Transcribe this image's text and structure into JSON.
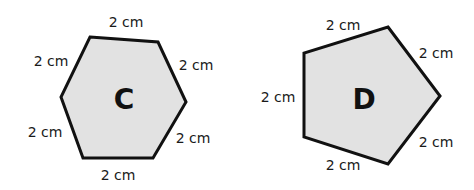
{
  "colors": {
    "fill": "#e2e2e2",
    "stroke": "#111111",
    "text": "#1a1a1a"
  },
  "shapes": {
    "hexagon": {
      "name": "C",
      "sides": 6,
      "side_length": "2 cm",
      "points": "90,37 158,42 186,102 153,158 83,158 61,97",
      "labels": [
        "2 cm",
        "2 cm",
        "2 cm",
        "2 cm",
        "2 cm",
        "2 cm"
      ]
    },
    "pentagon": {
      "name": "D",
      "sides": 5,
      "side_length": "2 cm",
      "points": "388,27 440,96 388,164 304,137 304,53",
      "labels": [
        "2 cm",
        "2 cm",
        "2 cm",
        "2 cm",
        "2 cm"
      ]
    }
  }
}
